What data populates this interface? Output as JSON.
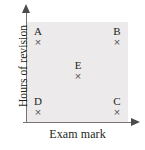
{
  "chart_data": {
    "type": "scatter",
    "title": "",
    "xlabel": "Exam mark",
    "ylabel": "Hours of revision",
    "xlim": [
      0,
      100
    ],
    "ylim": [
      0,
      100
    ],
    "grid": false,
    "legend": false,
    "axis_ticks": false,
    "plot_background": "#eceaea",
    "axis_color": "#777374",
    "marker_symbol": "×",
    "marker_color": "#585354",
    "points": [
      {
        "label": "A",
        "x": 11,
        "y": 84,
        "px": 38,
        "py": 38
      },
      {
        "label": "B",
        "x": 89,
        "y": 84,
        "px": 117,
        "py": 38
      },
      {
        "label": "E",
        "x": 50,
        "y": 50,
        "px": 78,
        "py": 72
      },
      {
        "label": "D",
        "x": 11,
        "y": 14,
        "px": 38,
        "py": 108
      },
      {
        "label": "C",
        "x": 89,
        "y": 14,
        "px": 117,
        "py": 108
      }
    ]
  },
  "figure": {
    "x_axis_label": "Exam mark",
    "y_axis_label": "Hours of revision"
  },
  "points": [
    {
      "label": "A",
      "marker": "×"
    },
    {
      "label": "B",
      "marker": "×"
    },
    {
      "label": "E",
      "marker": "×"
    },
    {
      "label": "D",
      "marker": "×"
    },
    {
      "label": "C",
      "marker": "×"
    }
  ]
}
